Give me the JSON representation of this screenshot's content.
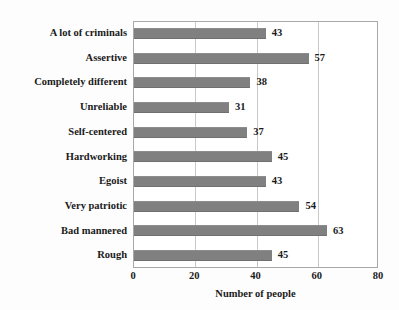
{
  "chart_data": {
    "type": "bar",
    "orientation": "horizontal",
    "title": "",
    "xlabel": "Number of people",
    "ylabel": "",
    "xlim": [
      0,
      80
    ],
    "xticks": [
      0,
      20,
      40,
      60,
      80
    ],
    "grid": true,
    "gridlines_at": [
      20,
      40,
      60
    ],
    "legend": null,
    "bar_color": "#808080",
    "categories": [
      "A lot of criminals",
      "Assertive",
      "Completely different",
      "Unreliable",
      "Self-centered",
      "Hardworking",
      "Egoist",
      "Very patriotic",
      "Bad mannered",
      "Rough"
    ],
    "values": [
      43,
      57,
      38,
      31,
      37,
      45,
      43,
      54,
      63,
      45
    ],
    "data_labels": [
      "43",
      "57",
      "38",
      "31",
      "37",
      "45",
      "43",
      "54",
      "63",
      "45"
    ],
    "tick_labels": [
      "0",
      "20",
      "40",
      "60",
      "80"
    ]
  }
}
